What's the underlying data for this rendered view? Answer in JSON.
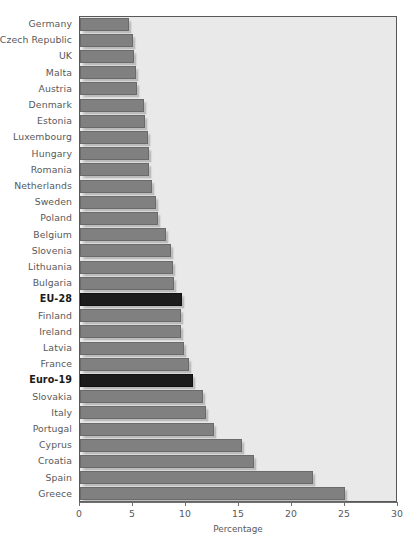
{
  "chart_data": {
    "type": "bar",
    "orientation": "horizontal",
    "title": "",
    "xlabel": "Percentage",
    "ylabel": "",
    "xlim": [
      0,
      30
    ],
    "xticks": [
      0,
      5,
      10,
      15,
      20,
      25,
      30
    ],
    "grid": false,
    "legend": null,
    "series_name": "Percentage",
    "bar_color": "#808080",
    "highlight_color": "#1c1c1c",
    "plot_background": "#e9e9e9",
    "label_color": "#58595b",
    "highlighted_categories": [
      "EU-28",
      "Euro-19"
    ],
    "categories": [
      "Germany",
      "Czech Republic",
      "UK",
      "Malta",
      "Austria",
      "Denmark",
      "Estonia",
      "Luxembourg",
      "Hungary",
      "Romania",
      "Netherlands",
      "Sweden",
      "Poland",
      "Belgium",
      "Slovenia",
      "Lithuania",
      "Bulgaria",
      "EU-28",
      "Finland",
      "Ireland",
      "Latvia",
      "France",
      "Euro-19",
      "Slovakia",
      "Italy",
      "Portugal",
      "Cyprus",
      "Croatia",
      "Spain",
      "Greece"
    ],
    "values": [
      4.6,
      5.0,
      5.1,
      5.3,
      5.4,
      6.0,
      6.1,
      6.4,
      6.5,
      6.5,
      6.8,
      7.2,
      7.4,
      8.1,
      8.6,
      8.8,
      8.9,
      9.6,
      9.5,
      9.5,
      9.8,
      10.3,
      10.7,
      11.6,
      11.9,
      12.6,
      15.3,
      16.4,
      22.0,
      25.0
    ]
  },
  "caption": ""
}
